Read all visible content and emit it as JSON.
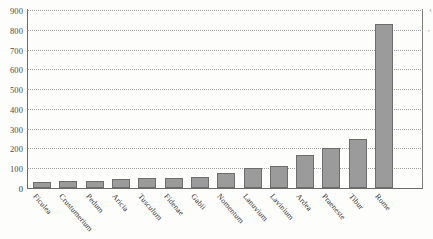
{
  "chart_data": {
    "type": "bar",
    "title": "",
    "subtitle": "",
    "xlabel": "",
    "ylabel": "",
    "ylim": [
      0,
      900
    ],
    "ytick_step": 100,
    "yticks": [
      900,
      800,
      700,
      600,
      500,
      400,
      300,
      200,
      100,
      0
    ],
    "grid": true,
    "grid_style": "dotted-horizontal",
    "legend": "none",
    "bar_color": "#9b9b9b",
    "bar_edge_color": "#6d6d6d",
    "categories": [
      "Ficulea",
      "Crustumerium",
      "Pedum",
      "Aricia",
      "Tusculum",
      "Fidenae",
      "Gabii",
      "Nomentum",
      "Lanuvium",
      "Lavinium",
      "Ardea",
      "Praeneste",
      "Tibur",
      "Rome"
    ],
    "values": [
      30,
      35,
      35,
      45,
      50,
      50,
      55,
      75,
      100,
      110,
      165,
      200,
      250,
      340
    ],
    "values_note": "bar heights read off the 100-unit gridlines",
    "series": [
      {
        "name": "size",
        "values": [
          30,
          35,
          35,
          45,
          50,
          50,
          55,
          75,
          100,
          110,
          165,
          200,
          250,
          340
        ]
      }
    ],
    "rome_value": 830
  },
  "artifacts": {
    "mark_top_right": "‹",
    "mark_right": "′"
  }
}
